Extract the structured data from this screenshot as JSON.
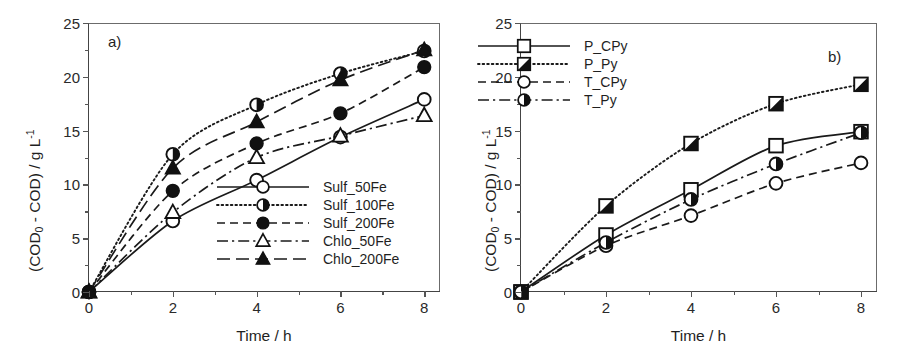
{
  "figure": {
    "panels": [
      {
        "label": "a)",
        "xlabel": "Time / h",
        "ylabel_parts": {
          "pre": "(COD",
          "sub": "0",
          "mid": " - COD) / g L",
          "sup": "-1"
        },
        "xticks": [
          "0",
          "2",
          "4",
          "6",
          "8"
        ],
        "yticks": [
          "0",
          "5",
          "10",
          "15",
          "20",
          "25"
        ],
        "legend": [
          {
            "label": "Sulf_50Fe",
            "marker": "open-circle",
            "dash": "solid"
          },
          {
            "label": "Sulf_100Fe",
            "marker": "half-circle",
            "dash": "dotted"
          },
          {
            "label": "Sulf_200Fe",
            "marker": "filled-circle",
            "dash": "dashed"
          },
          {
            "label": "Chlo_50Fe",
            "marker": "open-triangle",
            "dash": "dashdot"
          },
          {
            "label": "Chlo_200Fe",
            "marker": "filled-triangle",
            "dash": "longdash"
          }
        ]
      },
      {
        "label": "b)",
        "xlabel": "Time / h",
        "ylabel_parts": {
          "pre": "(COD",
          "sub": "0",
          "mid": " - COD) / g L",
          "sup": "-1"
        },
        "xticks": [
          "0",
          "2",
          "4",
          "6",
          "8"
        ],
        "yticks": [
          "0",
          "5",
          "10",
          "15",
          "20",
          "25"
        ],
        "legend": [
          {
            "label": "P_CPy",
            "marker": "open-square",
            "dash": "solid"
          },
          {
            "label": "P_Py",
            "marker": "half-square",
            "dash": "dotted"
          },
          {
            "label": "T_CPy",
            "marker": "open-circle",
            "dash": "dashed"
          },
          {
            "label": "T_Py",
            "marker": "half-circle",
            "dash": "dashdot"
          }
        ]
      }
    ]
  },
  "chart_data": [
    {
      "type": "line",
      "title": "a)",
      "xlabel": "Time / h",
      "ylabel": "(COD0 - COD) / g L-1",
      "x": [
        0,
        2,
        4,
        6,
        8
      ],
      "xlim": [
        0,
        8.4
      ],
      "ylim": [
        0,
        25
      ],
      "xticks": [
        0,
        2,
        4,
        6,
        8
      ],
      "yticks": [
        0,
        5,
        10,
        15,
        20,
        25
      ],
      "grid": false,
      "legend_position": "lower-right-inside",
      "series": [
        {
          "name": "Sulf_50Fe",
          "marker": "open-circle",
          "dash": "solid",
          "values": [
            0,
            6.6,
            10.4,
            14.4,
            17.9
          ]
        },
        {
          "name": "Sulf_100Fe",
          "marker": "half-circle",
          "dash": "dotted",
          "values": [
            0,
            12.8,
            17.4,
            20.3,
            22.4
          ]
        },
        {
          "name": "Sulf_200Fe",
          "marker": "filled-circle",
          "dash": "dashed",
          "values": [
            0,
            9.4,
            13.8,
            16.6,
            20.9
          ]
        },
        {
          "name": "Chlo_50Fe",
          "marker": "open-triangle",
          "dash": "dashdot",
          "values": [
            0,
            7.4,
            12.5,
            14.5,
            16.4
          ]
        },
        {
          "name": "Chlo_200Fe",
          "marker": "filled-triangle",
          "dash": "longdash",
          "values": [
            0,
            11.5,
            15.8,
            19.7,
            22.5
          ]
        }
      ]
    },
    {
      "type": "line",
      "title": "b)",
      "xlabel": "Time / h",
      "ylabel": "(COD0 - COD) / g L-1",
      "x": [
        0,
        2,
        4,
        6,
        8
      ],
      "xlim": [
        0,
        8.4
      ],
      "ylim": [
        0,
        25
      ],
      "xticks": [
        0,
        2,
        4,
        6,
        8
      ],
      "yticks": [
        0,
        5,
        10,
        15,
        20,
        25
      ],
      "grid": false,
      "legend_position": "upper-left-inside",
      "series": [
        {
          "name": "P_CPy",
          "marker": "open-square",
          "dash": "solid",
          "values": [
            0,
            5.3,
            9.5,
            13.6,
            14.9
          ]
        },
        {
          "name": "P_Py",
          "marker": "half-square",
          "dash": "dotted",
          "values": [
            0,
            8.0,
            13.8,
            17.5,
            19.3
          ]
        },
        {
          "name": "T_CPy",
          "marker": "open-circle",
          "dash": "dashed",
          "values": [
            0,
            4.3,
            7.1,
            10.1,
            12.0
          ]
        },
        {
          "name": "T_Py",
          "marker": "half-circle",
          "dash": "dashdot",
          "values": [
            0,
            4.6,
            8.6,
            11.9,
            14.8
          ]
        }
      ]
    }
  ],
  "colors": {
    "ink": "#1a1a1a",
    "axis": "#444444",
    "frame": "#6b6b6b"
  }
}
